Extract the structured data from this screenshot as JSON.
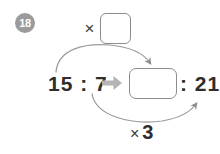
{
  "exercise": {
    "number": "18"
  },
  "top_operation": {
    "operator": "×",
    "operand_box_value": "",
    "operand_box_placeholder": ""
  },
  "equation": {
    "left_ratio": "15 : 7",
    "transform_icon": "right-block-arrow-icon",
    "answer_box_value": "",
    "answer_box_placeholder": "",
    "right_ratio": ": 21"
  },
  "bottom_operation": {
    "operator": "×",
    "value": "3"
  },
  "arrows": {
    "upper_label": "multiply-first-term-arrow",
    "lower_label": "multiply-second-term-arrow"
  },
  "colors": {
    "badge_fill": "#9b9b9b",
    "badge_text": "#ffffff",
    "box_border": "#8c8c8c",
    "math_text": "#2e2e2e",
    "curve_arrow": "#9a9a9a",
    "block_arrow": "#b4b4b4",
    "background": "#ffffff"
  }
}
